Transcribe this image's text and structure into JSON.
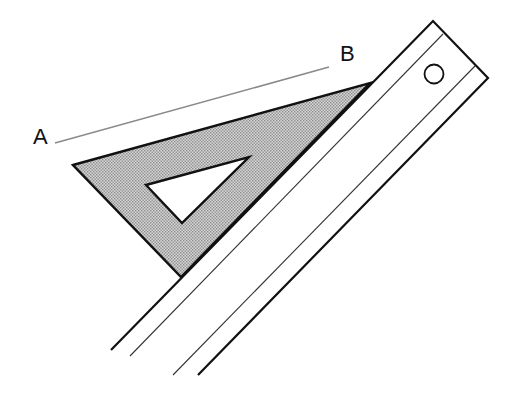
{
  "diagram": {
    "labels": {
      "point_a": "A",
      "point_b": "B"
    },
    "colors": {
      "stroke": "#111111",
      "line_ab": "#8a8a8a",
      "triangle_fill": "#c4c4c4",
      "background": "#ffffff"
    }
  }
}
